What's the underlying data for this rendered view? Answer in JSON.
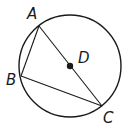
{
  "diagram": {
    "type": "geometry",
    "circle": {
      "center": "D",
      "cx": 70,
      "cy": 66,
      "r": 51
    },
    "points": [
      {
        "id": "A",
        "label": "A",
        "x": 39,
        "y": 26,
        "label_x": 27,
        "label_y": 19
      },
      {
        "id": "B",
        "label": "B",
        "x": 21,
        "y": 76,
        "label_x": 6,
        "label_y": 85
      },
      {
        "id": "C",
        "label": "C",
        "x": 102,
        "y": 106,
        "label_x": 103,
        "label_y": 123
      },
      {
        "id": "D",
        "label": "D",
        "x": 70,
        "y": 66,
        "label_x": 78,
        "label_y": 63
      }
    ],
    "segments": [
      {
        "from": "A",
        "to": "B"
      },
      {
        "from": "B",
        "to": "C"
      },
      {
        "from": "A",
        "to": "C"
      }
    ],
    "colors": {
      "stroke": "#1a1a1a",
      "background": "#ffffff"
    }
  }
}
